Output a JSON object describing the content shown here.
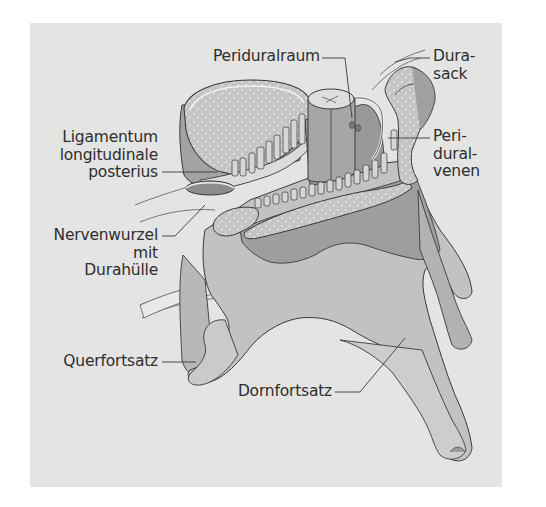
{
  "figure": {
    "background_color": "#e4e4e4",
    "bone_color": "#b4b4b4",
    "bone_shadow_color": "#9a9a9a",
    "spongiosa_color": "#cfcfcf",
    "outline_color": "#3a3a3a",
    "label_color": "#2e2e2e"
  },
  "labels": {
    "periduralraum": {
      "lines": [
        "Periduralraum"
      ]
    },
    "durasack": {
      "lines": [
        "Dura-",
        "sack"
      ]
    },
    "ligamentum": {
      "lines": [
        "Ligamentum",
        "longitudinale",
        "posterius"
      ]
    },
    "periduralvenen": {
      "lines": [
        "Peri-",
        "dural-",
        "venen"
      ]
    },
    "nervenwurzel": {
      "lines": [
        "Nervenwurzel",
        "mit",
        "Durahülle"
      ]
    },
    "querfortsatz": {
      "lines": [
        "Querfortsatz"
      ]
    },
    "dornfortsatz": {
      "lines": [
        "Dornfortsatz"
      ]
    }
  }
}
